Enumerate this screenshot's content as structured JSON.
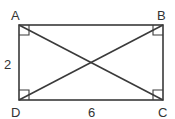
{
  "diagram": {
    "type": "rectangle-with-diagonals",
    "vertices": [
      {
        "label": "A",
        "x": 19,
        "y": 25
      },
      {
        "label": "B",
        "x": 163,
        "y": 25
      },
      {
        "label": "C",
        "x": 163,
        "y": 100
      },
      {
        "label": "D",
        "x": 19,
        "y": 100
      }
    ],
    "side_labels": {
      "left": "2",
      "bottom": "6"
    },
    "right_angles": [
      "A",
      "B",
      "C",
      "D"
    ],
    "diagonals": [
      "AC",
      "BD"
    ],
    "stroke_color": "#3a3a3a"
  }
}
